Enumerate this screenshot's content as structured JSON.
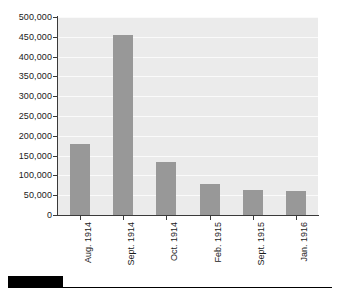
{
  "chart_data": {
    "type": "bar",
    "title": "",
    "xlabel": "",
    "ylabel": "",
    "categories": [
      "Aug. 1914",
      "Sept. 1914",
      "Oct. 1914",
      "Feb. 1915",
      "Sept. 1915",
      "Jan. 1916"
    ],
    "values": [
      180000,
      455000,
      135000,
      78000,
      62000,
      60000
    ],
    "ylim": [
      0,
      500000
    ],
    "yticks": [
      0,
      50000,
      100000,
      150000,
      200000,
      250000,
      300000,
      350000,
      400000,
      450000,
      500000
    ],
    "ytick_labels": [
      "0",
      "50,000",
      "100,000",
      "150,000",
      "200,000",
      "250,000",
      "300,000",
      "350,000",
      "400,000",
      "450,000",
      "500,000"
    ],
    "grid": true,
    "legend": null,
    "bar_color": "#989898",
    "plot_background": "#ebebeb",
    "gridline_color": "#fafafa",
    "axis_color": "#3a3a3a"
  },
  "footer": {
    "block_color": "#000000",
    "rule_color": "#000000"
  }
}
